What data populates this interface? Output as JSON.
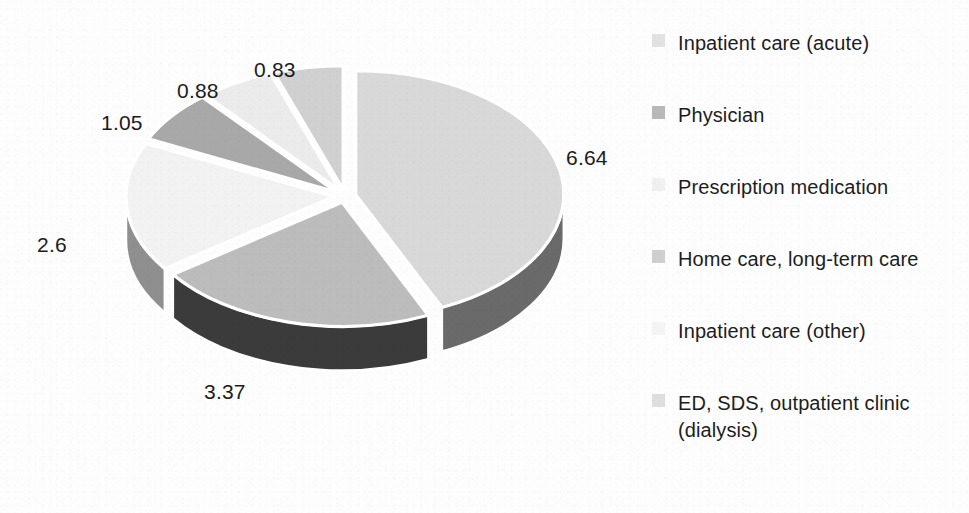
{
  "chart_data": {
    "type": "pie",
    "title": "",
    "subtitle": "",
    "xlabel": "",
    "ylabel": "",
    "legend_position": "right",
    "grid": false,
    "three_d": true,
    "exploded": true,
    "total": 15.37,
    "categories": [
      "Inpatient care (acute)",
      "Physician",
      "Prescription medication",
      "Home care, long-term care",
      "Inpatient care (other)",
      "ED, SDS, outpatient clinic (dialysis)"
    ],
    "values": [
      6.64,
      3.37,
      2.6,
      1.05,
      0.88,
      0.83
    ],
    "data_labels": [
      "6.64",
      "3.37",
      "2.6",
      "1.05",
      "0.88",
      "0.83"
    ],
    "colors": [
      "#d8d8d8",
      "#bcbcbc",
      "#f2f2f2",
      "#a8a8a8",
      "#ebebeb",
      "#d0d0d0"
    ],
    "slices": [
      {
        "label": "Inpatient care (acute)",
        "value": 6.64,
        "display": "6.64",
        "color": "#d8d8d8"
      },
      {
        "label": "Physician",
        "value": 3.37,
        "display": "3.37",
        "color": "#bcbcbc"
      },
      {
        "label": "Prescription medication",
        "value": 2.6,
        "display": "2.6",
        "color": "#f2f2f2"
      },
      {
        "label": "Home care, long-term care",
        "value": 1.05,
        "display": "1.05",
        "color": "#a8a8a8"
      },
      {
        "label": "Inpatient care (other)",
        "value": 0.88,
        "display": "0.88",
        "color": "#ebebeb"
      },
      {
        "label": "ED, SDS, outpatient clinic (dialysis)",
        "value": 0.83,
        "display": "0.83",
        "color": "#d0d0d0"
      }
    ]
  },
  "legend": {
    "items": [
      {
        "label": "Inpatient care (acute)",
        "swatch_color": "#e2e2e2",
        "swatch_name": "legend-swatch-inpatient-acute"
      },
      {
        "label": "Physician",
        "swatch_color": "#b9b9b9",
        "swatch_name": "legend-swatch-physician"
      },
      {
        "label": "Prescription medication",
        "swatch_color": "#f0f0f0",
        "swatch_name": "legend-swatch-prescription-medication"
      },
      {
        "label": "Home care, long-term care",
        "swatch_color": "#cfcfcf",
        "swatch_name": "legend-swatch-home-care"
      },
      {
        "label": "Inpatient care (other)",
        "swatch_color": "#f4f4f4",
        "swatch_name": "legend-swatch-inpatient-other"
      },
      {
        "label": "ED, SDS, outpatient clinic (dialysis)",
        "swatch_color": "#dedede",
        "swatch_name": "legend-swatch-ed-sds"
      }
    ]
  },
  "labels": {
    "v_664": "6.64",
    "v_337": "3.37",
    "v_26": "2.6",
    "v_105": "1.05",
    "v_088": "0.88",
    "v_083": "0.83"
  },
  "style": {
    "background": "#fdfdfd",
    "text_color": "#1c1c1c",
    "separator_color": "#ffffff"
  }
}
